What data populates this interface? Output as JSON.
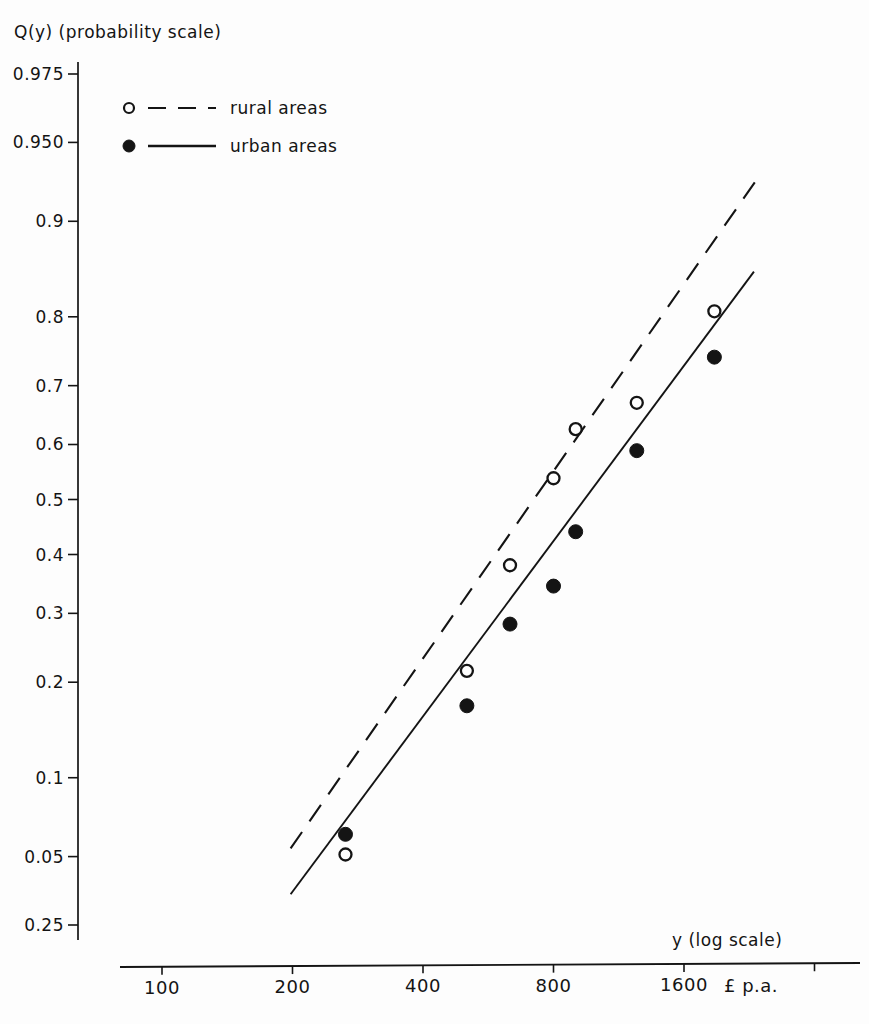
{
  "figure": {
    "background_color": "#fdfdfd",
    "ink_color": "#141414"
  },
  "axes": {
    "y_axis_title": "Q(y) (probability scale)",
    "x_axis_title": "y (log scale)",
    "x_unit_label": "£ p.a."
  },
  "legend": {
    "entries": [
      {
        "label": "rural areas",
        "marker": "open-circle",
        "line": "dashed"
      },
      {
        "label": "urban areas",
        "marker": "filled-circle",
        "line": "solid"
      }
    ]
  },
  "chart_data": {
    "type": "scatter",
    "subtitle": "",
    "xlabel": "y (log scale)",
    "ylabel": "Q(y) (probability scale)",
    "xscale": "log2",
    "yscale": "probability (normal probability scale)",
    "grid": false,
    "legend_position": "top-left-inside",
    "x_unit": "£ p.a.",
    "xticks": [
      100,
      200,
      400,
      800,
      1600
    ],
    "xtick_labels": [
      "100",
      "200",
      "400",
      "800",
      "1600"
    ],
    "xlim": [
      100,
      2460
    ],
    "yticks": [
      0.975,
      0.95,
      0.9,
      0.8,
      0.7,
      0.6,
      0.5,
      0.4,
      0.3,
      0.2,
      0.1,
      0.05,
      0.025
    ],
    "ytick_labels": [
      "0.975",
      "0.950",
      "0.9",
      "0.8",
      "0.7",
      "0.6",
      "0.5",
      "0.4",
      "0.3",
      "0.2",
      "0.1",
      "0.05",
      "0.25"
    ],
    "ylim": [
      0.025,
      0.975
    ],
    "series": [
      {
        "name": "rural areas",
        "marker": "open-circle",
        "line_style": "dashed",
        "points": [
          {
            "x": 265,
            "y": 0.051
          },
          {
            "x": 505,
            "y": 0.215
          },
          {
            "x": 635,
            "y": 0.381
          },
          {
            "x": 800,
            "y": 0.539
          },
          {
            "x": 900,
            "y": 0.627
          },
          {
            "x": 1245,
            "y": 0.672
          },
          {
            "x": 1880,
            "y": 0.807
          }
        ],
        "fit_line": {
          "x_start": 198,
          "y_start": 0.054,
          "x_end": 2330,
          "y_end": 0.928
        }
      },
      {
        "name": "urban areas",
        "marker": "filled-circle",
        "line_style": "solid",
        "points": [
          {
            "x": 265,
            "y": 0.0615
          },
          {
            "x": 505,
            "y": 0.171
          },
          {
            "x": 635,
            "y": 0.283
          },
          {
            "x": 800,
            "y": 0.345
          },
          {
            "x": 900,
            "y": 0.441
          },
          {
            "x": 1245,
            "y": 0.589
          },
          {
            "x": 1880,
            "y": 0.744
          }
        ],
        "fit_line": {
          "x_start": 198,
          "y_start": 0.0345,
          "x_end": 2320,
          "y_end": 0.853
        }
      }
    ]
  }
}
